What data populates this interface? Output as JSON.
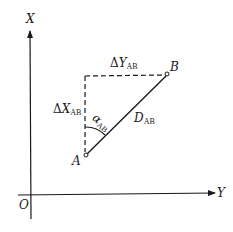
{
  "diagram": {
    "type": "coordinate-azimuth-diagram",
    "axes": {
      "vertical_label": "X",
      "horizontal_label": "Y",
      "origin_label": "O"
    },
    "points": {
      "A": {
        "label": "A"
      },
      "B": {
        "label": "B"
      }
    },
    "labels": {
      "delta_y": {
        "prefix": "Δ",
        "symbol": "Y",
        "sub": "AB"
      },
      "delta_x": {
        "prefix": "Δ",
        "symbol": "X",
        "sub": "AB"
      },
      "distance": {
        "symbol": "D",
        "sub": "AB"
      },
      "azimuth": {
        "symbol": "α",
        "sub": "AB"
      }
    },
    "colors": {
      "line": "#1a1a1a",
      "background": "#ffffff"
    }
  }
}
